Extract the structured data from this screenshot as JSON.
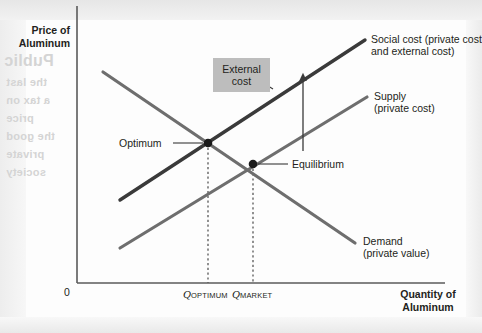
{
  "figure": {
    "axis_y_title": "Price of\nAluminum",
    "axis_y_title_line1": "Price of",
    "axis_y_title_line2": "Aluminum",
    "axis_x_title_line1": "Quantity of",
    "axis_x_title_line2": "Aluminum",
    "origin_label": "0"
  },
  "curves": [
    {
      "id": "social-cost",
      "label_line1": "Social cost (private cost",
      "label_line2": "and external cost)",
      "color": "#3a3a3a",
      "width": 3.2,
      "x1": 43,
      "y1": 178,
      "x2": 288,
      "y2": 18
    },
    {
      "id": "supply",
      "label_line1": "Supply",
      "label_line2": "(private cost)",
      "color": "#6e6e6e",
      "width": 3.2,
      "x1": 43,
      "y1": 226,
      "x2": 290,
      "y2": 75
    },
    {
      "id": "demand",
      "label_line1": "Demand",
      "label_line2": "(private value)",
      "color": "#6e6e6e",
      "width": 3.2,
      "x1": 26,
      "y1": 50,
      "x2": 278,
      "y2": 221
    }
  ],
  "points": [
    {
      "id": "optimum",
      "label": "Optimum",
      "x": 131,
      "y": 121
    },
    {
      "id": "equilibrium",
      "label": "Equilibrium",
      "x": 176,
      "y": 142
    }
  ],
  "annotations": {
    "external_cost_line1": "External",
    "external_cost_line2": "cost"
  },
  "ticks": [
    {
      "id": "q-optimum",
      "q": "Q",
      "sub": "OPTIMUM",
      "x": 131
    },
    {
      "id": "q-market",
      "q": "Q",
      "sub": "MARKET",
      "x": 176
    }
  ],
  "bleed_text": [
    "Public",
    "the last",
    "a tax on",
    "price",
    "the good",
    "private",
    "society"
  ]
}
